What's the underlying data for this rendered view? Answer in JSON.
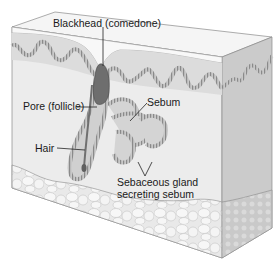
{
  "diagram": {
    "labels": {
      "blackhead": "Blackhead (comedone)",
      "pore": "Pore (follicle)",
      "sebum": "Sebum",
      "hair": "Hair",
      "gland_line1": "Sebaceous gland",
      "gland_line2": "secreting sebum"
    },
    "colors": {
      "epidermis_top": "#f2f2f2",
      "dermis": "#e6e6e6",
      "dermis_side": "#c9c9c9",
      "papillae": "#b5b5b5",
      "blackhead": "#6b6b6b",
      "fat": "#ededed",
      "outline": "#777777"
    }
  }
}
